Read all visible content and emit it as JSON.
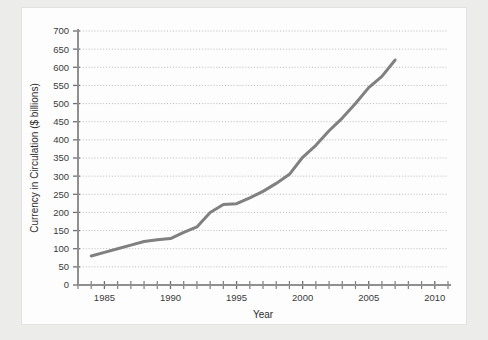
{
  "chart_data": {
    "type": "line",
    "title": "",
    "xlabel": "Year",
    "ylabel": "Currency in Circulation ($ billions)",
    "xlim": [
      1983,
      2011
    ],
    "ylim": [
      0,
      700
    ],
    "grid": true,
    "legend": false,
    "x_tick_labels": [
      "1985",
      "1990",
      "1995",
      "2000",
      "2005",
      "2010"
    ],
    "x_tick_values": [
      1985,
      1990,
      1995,
      2000,
      2005,
      2010
    ],
    "x_minor_tick_interval": 1,
    "y_tick_labels": [
      "0",
      "50",
      "100",
      "150",
      "200",
      "250",
      "300",
      "350",
      "400",
      "450",
      "500",
      "550",
      "600",
      "650",
      "700"
    ],
    "y_tick_values": [
      0,
      50,
      100,
      150,
      200,
      250,
      300,
      350,
      400,
      450,
      500,
      550,
      600,
      650,
      700
    ],
    "series": [
      {
        "name": "Currency in Circulation",
        "color": "#808080",
        "x": [
          1984,
          1985,
          1986,
          1987,
          1988,
          1989,
          1990,
          1991,
          1992,
          1993,
          1994,
          1995,
          1996,
          1997,
          1998,
          1999,
          2000,
          2001,
          2002,
          2003,
          2004,
          2005,
          2006,
          2007
        ],
        "values": [
          80,
          90,
          100,
          110,
          120,
          125,
          128,
          145,
          160,
          200,
          222,
          224,
          240,
          258,
          280,
          305,
          352,
          385,
          425,
          460,
          500,
          544,
          575,
          620
        ]
      }
    ]
  },
  "axis": {
    "x_title": "Year",
    "y_title": "Currency in Circulation ($ billions)"
  }
}
